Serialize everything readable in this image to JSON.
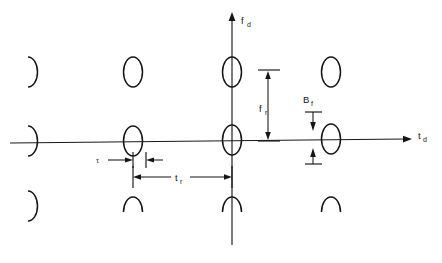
{
  "figure": {
    "width": 442,
    "height": 263,
    "background": "#ffffff",
    "ink_color": "#151515"
  },
  "axes": {
    "vertical": {
      "label_main": "f",
      "label_sub": "d",
      "name": "doppler-frequency-axis",
      "x": 232,
      "y_top": 14,
      "y_bottom": 245
    },
    "horizontal": {
      "label_main": "t",
      "label_sub": "d",
      "name": "delay-time-axis",
      "y": 140,
      "x_left": 10,
      "x_right": 412
    }
  },
  "dimensions": [
    {
      "id": "f_r",
      "label_main": "f",
      "label_sub": "r",
      "orientation": "vertical",
      "meaning": "pulse-repetition-frequency-spacing",
      "x": 268,
      "y_start": 70,
      "y_end": 140,
      "label_x": 262,
      "label_y": 108
    },
    {
      "id": "B_f",
      "label_main": "B",
      "label_sub": "f",
      "orientation": "vertical",
      "meaning": "doppler-response-width",
      "x": 313,
      "y_top_tick": 128,
      "y_bottom_tick": 152,
      "label_x": 305,
      "label_y": 100
    },
    {
      "id": "t_r",
      "label_main": "t",
      "label_sub": "r",
      "orientation": "horizontal",
      "meaning": "pulse-repetition-interval",
      "y": 177,
      "x_start": 133,
      "x_end": 232,
      "label_x": 178,
      "label_y": 180
    },
    {
      "id": "tau",
      "label_main": "τ",
      "label_sub": "",
      "orientation": "horizontal",
      "meaning": "pulse-width",
      "y": 160,
      "x_start": 133,
      "x_end": 145,
      "label_x": 99,
      "label_y": 163
    }
  ],
  "grid": {
    "columns": [
      33,
      133,
      232,
      331
    ],
    "rows": [
      72,
      140,
      205
    ],
    "blob_rx": 9.5,
    "blob_ry": 15
  },
  "blobs": [
    {
      "col": 0,
      "row": 0,
      "shape": "right-half",
      "name": "response-blob-clipped-left-top"
    },
    {
      "col": 1,
      "row": 0,
      "shape": "full",
      "name": "response-blob-full"
    },
    {
      "col": 2,
      "row": 0,
      "shape": "full",
      "name": "response-blob-on-doppler-axis"
    },
    {
      "col": 3,
      "row": 0,
      "shape": "full",
      "name": "response-blob-full"
    },
    {
      "col": 0,
      "row": 1,
      "shape": "right-half",
      "name": "response-blob-clipped-left-mid"
    },
    {
      "col": 1,
      "row": 1,
      "shape": "full",
      "name": "response-blob-full"
    },
    {
      "col": 2,
      "row": 1,
      "shape": "full",
      "name": "response-blob-at-origin"
    },
    {
      "col": 3,
      "row": 1,
      "shape": "full",
      "name": "response-blob-full"
    },
    {
      "col": 0,
      "row": 2,
      "shape": "right-half",
      "name": "response-blob-clipped-left-bottom"
    },
    {
      "col": 1,
      "row": 2,
      "shape": "top-half",
      "name": "response-blob-clipped-bottom"
    },
    {
      "col": 2,
      "row": 2,
      "shape": "top-half",
      "name": "response-blob-clipped-bottom"
    },
    {
      "col": 3,
      "row": 2,
      "shape": "top-half",
      "name": "response-blob-clipped-bottom"
    }
  ]
}
